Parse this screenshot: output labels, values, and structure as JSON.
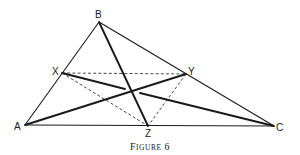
{
  "figure": {
    "caption_first": "F",
    "caption_rest": "IGURE",
    "caption_number": "6",
    "caption_full": "Figure 6"
  },
  "points": {
    "A": {
      "label": "A",
      "x": 25,
      "y": 125
    },
    "B": {
      "label": "B",
      "x": 99,
      "y": 22
    },
    "C": {
      "label": "C",
      "x": 274,
      "y": 126
    },
    "X": {
      "label": "X",
      "x": 62,
      "y": 73
    },
    "Y": {
      "label": "Y",
      "x": 186,
      "y": 74
    },
    "Z": {
      "label": "Z",
      "x": 148,
      "y": 126
    }
  },
  "segments": {
    "triangle": [
      "AB",
      "BC",
      "CA"
    ],
    "cevians_thick": [
      "BZ",
      "AY",
      "XC"
    ],
    "dashed": [
      "XY",
      "XZ",
      "YZ"
    ]
  },
  "colors": {
    "ink": "#1a1a1a",
    "background": "#ffffff"
  }
}
